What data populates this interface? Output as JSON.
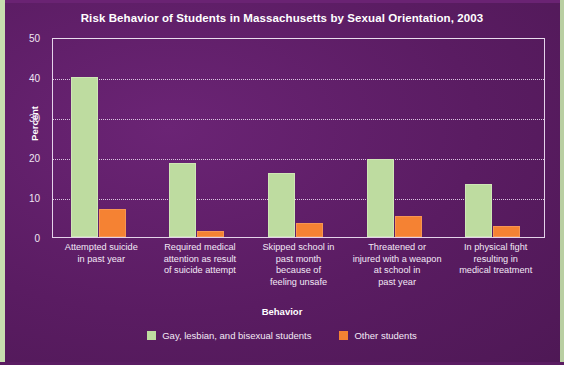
{
  "title": "Risk Behavior of Students in Massachusetts by Sexual Orientation, 2003",
  "axis": {
    "ylabel": "Percent",
    "xlabel_legend_title": "Behavior",
    "yticks": [
      "0",
      "10",
      "20",
      "30",
      "40",
      "50"
    ]
  },
  "legend": {
    "items": [
      {
        "label": "Gay, lesbian, and bisexual students",
        "color": "#BEDCA0",
        "icon": "legend-swatch-green"
      },
      {
        "label": "Other students",
        "color": "#F58233",
        "icon": "legend-swatch-orange"
      }
    ]
  },
  "colors": {
    "background": "#5E1E66",
    "plot_border": "#E4D2EA",
    "gridline": "#E3CFEA",
    "series_gay_lesbian_bisexual": "#BEDCA0",
    "series_other": "#F58233",
    "text": "#FFFFFF"
  },
  "chart_data": {
    "type": "bar",
    "title": "Risk Behavior of Students in Massachusetts by Sexual Orientation, 2003",
    "xlabel": "Behavior",
    "ylabel": "Percent",
    "ylim": [
      0,
      50
    ],
    "yticks": [
      0,
      10,
      20,
      30,
      40,
      50
    ],
    "grid": true,
    "legend_position": "bottom",
    "categories": [
      "Attempted suicide in past year",
      "Required medical attention as result of suicide attempt",
      "Skipped school in past month because of feeling unsafe",
      "Threatened or injured with a weapon at school  in past year",
      "In physical fight resulting in medical treatment"
    ],
    "category_lines": [
      [
        "Attempted suicide",
        "in past year"
      ],
      [
        "Required medical",
        "attention as result",
        "of suicide attempt"
      ],
      [
        "Skipped school in",
        "past month",
        "because of",
        "feeling unsafe"
      ],
      [
        "Threatened or",
        "injured with a weapon",
        "at school  in",
        "past year"
      ],
      [
        "In physical fight",
        "resulting in",
        "medical treatment"
      ]
    ],
    "series": [
      {
        "name": "Gay, lesbian, and bisexual students",
        "color": "#BEDCA0",
        "values": [
          40,
          18.5,
          16,
          19.5,
          13.3
        ]
      },
      {
        "name": "Other students",
        "color": "#F58233",
        "values": [
          7,
          1.5,
          3.5,
          5.3,
          2.8
        ]
      }
    ]
  }
}
